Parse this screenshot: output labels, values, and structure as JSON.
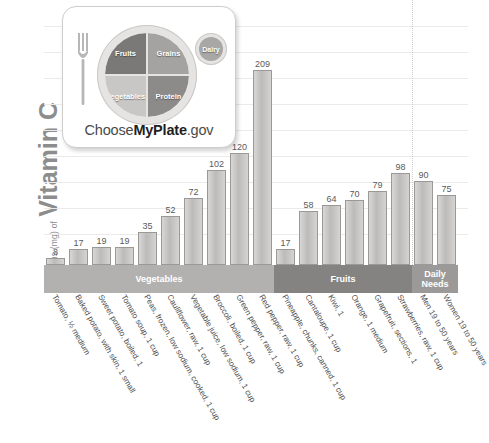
{
  "chart_data": {
    "type": "bar",
    "title": "",
    "ylabel_small": "Milligrams (mg) of",
    "ylabel_big": "Vitamin C",
    "xlabel": "",
    "ylim": [
      0,
      250
    ],
    "grid": true,
    "gridline_count": 9,
    "legend": "none",
    "categories": [
      "Tomato, ½ medium",
      "Baked potato, with skin, 1 small",
      "Sweet potato, boiled, 1",
      "Tomato soup, 1 cup",
      "Peas, frozen, low sodium, cooked, 1 cup",
      "Cauliflower, raw, 1 cup",
      "Vegetable juice, low sodium, 1 cup",
      "Broccoli, boiled, 1 cup",
      "Green pepper, raw, 1 cup",
      "Red pepper, raw, 1 cup",
      "Pineapple, chunks, canned, 1 cup",
      "Cantaloupe, 1 cup",
      "Kiwi, 1",
      "Orange, 1 medium",
      "Grapefruit, sections, 1",
      "Strawberries, raw, 1 cup",
      "Men 19 to 50 years",
      "Women 19 to 50 years"
    ],
    "values": [
      8,
      17,
      19,
      19,
      35,
      52,
      72,
      102,
      120,
      209,
      17,
      58,
      64,
      70,
      79,
      98,
      90,
      75
    ],
    "groups": [
      {
        "label": "Vegetables",
        "count": 10
      },
      {
        "label": "Fruits",
        "count": 6
      },
      {
        "label": "Daily\nNeeds",
        "count": 2
      }
    ],
    "group_labels": {
      "vegetables": "Vegetables",
      "fruits": "Fruits",
      "daily_needs_line1": "Daily",
      "daily_needs_line2": "Needs"
    },
    "colors": {
      "bar_fill": "#c6c4c2",
      "bar_stroke": "#9b9997",
      "band_vegetables": "#b3b1af",
      "band_fruits": "#858381",
      "band_daily_needs": "#9c9a98",
      "gridline": "#eceae9",
      "axis_title": "#8d8d8d",
      "value_label": "#5a5a5a"
    }
  },
  "myplate": {
    "fruits": "Fruits",
    "grains": "Grains",
    "vegetables": "Vegetables",
    "protein": "Protein",
    "dairy": "Dairy",
    "wordmark_pre": "Choose",
    "wordmark_bold": "MyPlate",
    "wordmark_post": ".gov"
  }
}
